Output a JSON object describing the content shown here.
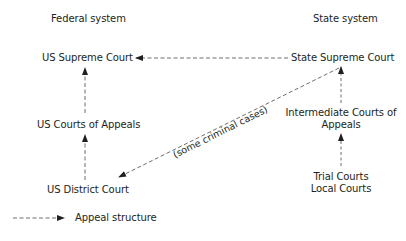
{
  "headers": {
    "federal": "Federal system",
    "state": "State system"
  },
  "federal_nodes": {
    "supreme": "US Supreme Court",
    "appeals": "US Courts of Appeals",
    "district": "US District Court"
  },
  "state_nodes": {
    "supreme": "State Supreme Court",
    "intermediate_line1": "Intermediate Courts of",
    "intermediate_line2": "Appeals",
    "trial_line1": "Trial Courts",
    "trial_line2": "Local Courts"
  },
  "edges": [
    {
      "from": "US District Court",
      "to": "US Courts of Appeals",
      "style": "dashed"
    },
    {
      "from": "US Courts of Appeals",
      "to": "US Supreme Court",
      "style": "dashed"
    },
    {
      "from": "State Supreme Court",
      "to": "US Supreme Court",
      "style": "dashed"
    },
    {
      "from": "Trial Courts / Local Courts",
      "to": "Intermediate Courts of Appeals",
      "style": "dashed"
    },
    {
      "from": "Intermediate Courts of Appeals",
      "to": "State Supreme Court",
      "style": "dashed"
    },
    {
      "from": "State Supreme Court",
      "to": "US District Court",
      "style": "dashed",
      "label": "(some criminal cases)"
    }
  ],
  "diagonal_label": "(some criminal cases)",
  "legend": {
    "label": "Appeal structure"
  },
  "colors": {
    "ink": "#231f20",
    "line": "#4a4a4a",
    "background": "#ffffff"
  }
}
